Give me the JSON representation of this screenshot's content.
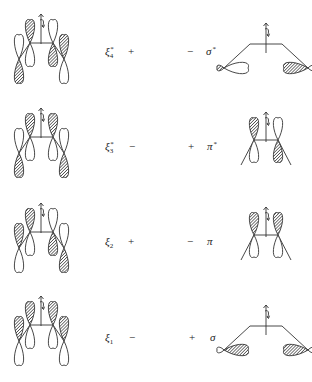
{
  "diagram": {
    "rows": [
      {
        "left_label": {
          "base": "ξ",
          "sub": "4",
          "sup": "*"
        },
        "left_sign": "+",
        "right_sign": "−",
        "right_label": {
          "base": "σ",
          "sup": "*"
        },
        "left_phases": {
          "outer_left": "down",
          "inner_left": "up",
          "inner_right": "down",
          "outer_right": "up"
        },
        "right_type": "sigma",
        "right_phases": {
          "left_inner_shaded": false,
          "right_inner_shaded": true
        }
      },
      {
        "left_label": {
          "base": "ξ",
          "sub": "3",
          "sup": "*"
        },
        "left_sign": "−",
        "right_sign": "+",
        "right_label": {
          "base": "π",
          "sup": "*"
        },
        "left_phases": {
          "outer_left": "down",
          "inner_left": "up",
          "inner_right": "up",
          "outer_right": "down"
        },
        "right_type": "pi",
        "right_phases": {
          "left_up_shaded": true,
          "right_up_shaded": false
        }
      },
      {
        "left_label": {
          "base": "ξ",
          "sub": "2",
          "sup": ""
        },
        "left_sign": "+",
        "right_sign": "−",
        "right_label": {
          "base": "π",
          "sup": ""
        },
        "left_phases": {
          "outer_left": "up",
          "inner_left": "up",
          "inner_right": "down",
          "outer_right": "down"
        },
        "right_type": "pi",
        "right_phases": {
          "left_up_shaded": true,
          "right_up_shaded": true
        }
      },
      {
        "left_label": {
          "base": "ξ",
          "sub": "1",
          "sup": ""
        },
        "left_sign": "−",
        "right_sign": "+",
        "right_label": {
          "base": "σ",
          "sup": ""
        },
        "left_phases": {
          "outer_left": "up",
          "inner_left": "up",
          "inner_right": "up",
          "outer_right": "up"
        },
        "right_type": "sigma",
        "right_phases": {
          "left_inner_shaded": true,
          "right_inner_shaded": true
        }
      }
    ]
  }
}
